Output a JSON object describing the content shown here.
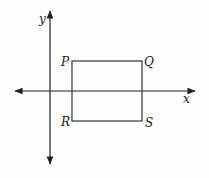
{
  "diagram": {
    "axes": {
      "x_label": "x",
      "y_label": "y"
    },
    "rectangle": {
      "vertices": {
        "top_left": "P",
        "top_right": "Q",
        "bottom_left": "R",
        "bottom_right": "S"
      }
    },
    "colors": {
      "line": "#222222",
      "background": "#fdfdfd"
    }
  }
}
